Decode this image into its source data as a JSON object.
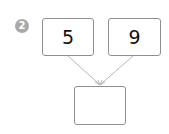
{
  "problem": {
    "number": "2",
    "top_left_value": "5",
    "top_right_value": "9",
    "bottom_value": ""
  },
  "colors": {
    "badge": "#a9a9a9",
    "box_border": "#8f8f8f",
    "arrow": "#b8b8b8"
  }
}
